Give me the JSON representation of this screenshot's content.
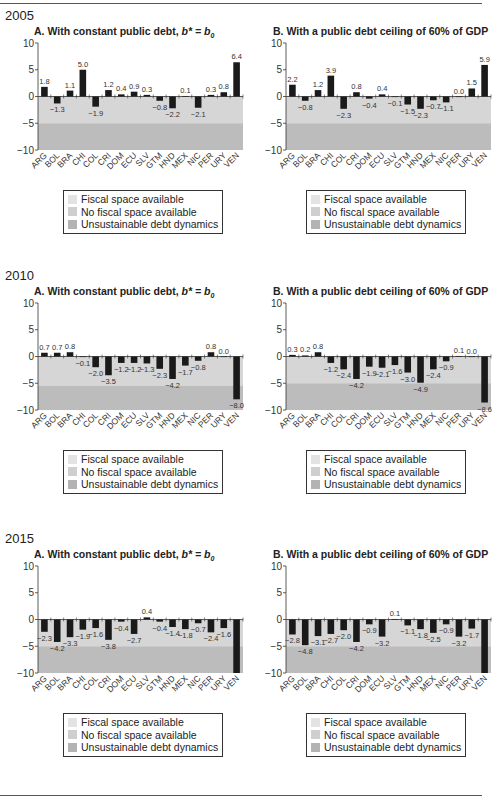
{
  "countries": [
    "ARG",
    "BOL",
    "BRA",
    "CHI",
    "COL",
    "CRI",
    "DOM",
    "ECU",
    "SLV",
    "GTM",
    "HND",
    "MEX",
    "NIC",
    "PER",
    "URY",
    "VEN"
  ],
  "legend": [
    {
      "label": "Fiscal space available",
      "color": "#e3e3e3"
    },
    {
      "label": "No fiscal space available",
      "color": "#cfcfcf"
    },
    {
      "label": "Unsustainable debt dynamics",
      "color": "#b3b3b3"
    }
  ],
  "colors": {
    "zone_no_space": "#d6d6d6",
    "zone_unsustainable": "#bcbcbc",
    "bar": "#1a1a1a",
    "axis": "#333333"
  },
  "years": [
    {
      "year": "2005",
      "panels": [
        {
          "title_prefix": "A. With constant public debt, ",
          "title_math": "b* = b",
          "title_sub": "0",
          "threshold": -5.0,
          "values": [
            1.8,
            -1.3,
            1.1,
            5.0,
            -1.9,
            1.2,
            0.4,
            0.9,
            0.3,
            -0.8,
            -2.2,
            0.1,
            -2.1,
            0.3,
            0.8,
            6.4
          ],
          "labels": [
            "1.8",
            "−1.3",
            "1.1",
            "5.0",
            "−1.9",
            "1.2",
            "0.4",
            "0.9",
            "0.3",
            "−0.8",
            "−2.2",
            "0.1",
            "−2.1",
            "0.3",
            "0.8",
            "6.4"
          ]
        },
        {
          "title_prefix": "B. With a public debt ceiling of 60% of GDP",
          "title_math": "",
          "title_sub": "",
          "threshold": -5.0,
          "values": [
            2.2,
            -0.8,
            1.2,
            3.9,
            -2.3,
            0.8,
            -0.4,
            0.4,
            -0.1,
            -1.5,
            -2.3,
            -0.7,
            -1.1,
            0.0,
            1.5,
            5.9
          ],
          "labels": [
            "2.2",
            "−0.8",
            "1.2",
            "3.9",
            "−2.3",
            "0.8",
            "−0.4",
            "0.4",
            "−0.1",
            "−1.5",
            "−2.3",
            "−0.7",
            "−1.1",
            "0.0",
            "1.5",
            "5.9"
          ]
        }
      ]
    },
    {
      "year": "2010",
      "panels": [
        {
          "title_prefix": "A. With constant public debt, ",
          "title_math": "b* = b",
          "title_sub": "0",
          "threshold": -5.5,
          "values": [
            0.7,
            0.7,
            0.8,
            -0.1,
            -2.0,
            -3.5,
            -1.2,
            -1.2,
            -1.3,
            -2.3,
            -4.2,
            -1.7,
            -0.8,
            0.8,
            0.0,
            -8.0
          ],
          "labels": [
            "0.7",
            "0.7",
            "0.8",
            "−0.1",
            "−2.0",
            "−3.5",
            "−1.2",
            "−1.2",
            "−1.3",
            "−2.3",
            "−4.2",
            "−1.7",
            "−0.8",
            "0.8",
            "0.0",
            "−8.0"
          ]
        },
        {
          "title_prefix": "B. With a public debt ceiling of 60% of GDP",
          "title_math": "",
          "title_sub": "",
          "threshold": -5.0,
          "values": [
            0.3,
            0.2,
            0.8,
            -1.2,
            -2.4,
            -4.2,
            -1.9,
            -2.1,
            -1.6,
            -3.0,
            -4.9,
            -2.4,
            -0.9,
            0.1,
            0.0,
            -8.6
          ],
          "labels": [
            "0.3",
            "0.2",
            "0.8",
            "−1.2",
            "−2.4",
            "−4.2",
            "−1.9",
            "−2.1",
            "−1.6",
            "−3.0",
            "−4.9",
            "−2.4",
            "−0.9",
            "0.1",
            "0.0",
            "−8.6"
          ]
        }
      ]
    },
    {
      "year": "2015",
      "panels": [
        {
          "title_prefix": "A. With constant public debt, ",
          "title_math": "b* = b",
          "title_sub": "0",
          "threshold": -5.0,
          "values": [
            -2.3,
            -4.2,
            -3.3,
            -1.9,
            -1.6,
            -3.8,
            -0.4,
            -2.7,
            0.4,
            -0.4,
            -1.4,
            -1.8,
            -0.7,
            -2.4,
            -1.6,
            -10.0
          ],
          "labels": [
            "−2.3",
            "−4.2",
            "−3.3",
            "−1.9",
            "−1.6",
            "−3.8",
            "−0.4",
            "−2.7",
            "0.4",
            "−0.4",
            "−1.4",
            "−1.8",
            "−0.7",
            "−2.4",
            "−1.6",
            ""
          ]
        },
        {
          "title_prefix": "B. With a public debt ceiling of 60% of GDP",
          "title_math": "",
          "title_sub": "",
          "threshold": -5.0,
          "values": [
            -2.8,
            -4.8,
            -3.1,
            -2.7,
            -2.0,
            -4.2,
            -0.9,
            -3.2,
            0.1,
            -1.1,
            -1.8,
            -2.5,
            -0.9,
            -3.2,
            -1.7,
            -10.0
          ],
          "labels": [
            "−2.8",
            "−4.8",
            "−3.1",
            "−2.7",
            "−2.0",
            "−4.2",
            "−0.9",
            "−3.2",
            "0.1",
            "−1.1",
            "−1.8",
            "−2.5",
            "−0.9",
            "−3.2",
            "−1.7",
            ""
          ]
        }
      ]
    }
  ],
  "axis": {
    "ymin": -10,
    "ymax": 10,
    "ticks": [
      "10",
      "5",
      "0",
      "−5",
      "−10"
    ]
  },
  "chart_data": [
    {
      "type": "bar",
      "title": "2005 A. With constant public debt, b* = b0",
      "categories": [
        "ARG",
        "BOL",
        "BRA",
        "CHI",
        "COL",
        "CRI",
        "DOM",
        "ECU",
        "SLV",
        "GTM",
        "HND",
        "MEX",
        "NIC",
        "PER",
        "URY",
        "VEN"
      ],
      "values": [
        1.8,
        -1.3,
        1.1,
        5.0,
        -1.9,
        1.2,
        0.4,
        0.9,
        0.3,
        -0.8,
        -2.2,
        0.1,
        -2.1,
        0.3,
        0.8,
        6.4
      ],
      "ylim": [
        -10,
        10
      ],
      "zones": {
        "no_fiscal_space": [
          -5,
          0
        ],
        "unsustainable": [
          -10,
          -5
        ]
      }
    },
    {
      "type": "bar",
      "title": "2005 B. With a public debt ceiling of 60% of GDP",
      "categories": [
        "ARG",
        "BOL",
        "BRA",
        "CHI",
        "COL",
        "CRI",
        "DOM",
        "ECU",
        "SLV",
        "GTM",
        "HND",
        "MEX",
        "NIC",
        "PER",
        "URY",
        "VEN"
      ],
      "values": [
        2.2,
        -0.8,
        1.2,
        3.9,
        -2.3,
        0.8,
        -0.4,
        0.4,
        -0.1,
        -1.5,
        -2.3,
        -0.7,
        -1.1,
        0.0,
        1.5,
        5.9
      ],
      "ylim": [
        -10,
        10
      ],
      "zones": {
        "no_fiscal_space": [
          -5,
          0
        ],
        "unsustainable": [
          -10,
          -5
        ]
      }
    },
    {
      "type": "bar",
      "title": "2010 A. With constant public debt, b* = b0",
      "categories": [
        "ARG",
        "BOL",
        "BRA",
        "CHI",
        "COL",
        "CRI",
        "DOM",
        "ECU",
        "SLV",
        "GTM",
        "HND",
        "MEX",
        "NIC",
        "PER",
        "URY",
        "VEN"
      ],
      "values": [
        0.7,
        0.7,
        0.8,
        -0.1,
        -2.0,
        -3.5,
        -1.2,
        -1.2,
        -1.3,
        -2.3,
        -4.2,
        -1.7,
        -0.8,
        0.8,
        0.0,
        -8.0
      ],
      "ylim": [
        -10,
        10
      ],
      "zones": {
        "no_fiscal_space": [
          -5.5,
          0
        ],
        "unsustainable": [
          -10,
          -5.5
        ]
      }
    },
    {
      "type": "bar",
      "title": "2010 B. With a public debt ceiling of 60% of GDP",
      "categories": [
        "ARG",
        "BOL",
        "BRA",
        "CHI",
        "COL",
        "CRI",
        "DOM",
        "ECU",
        "SLV",
        "GTM",
        "HND",
        "MEX",
        "NIC",
        "PER",
        "URY",
        "VEN"
      ],
      "values": [
        0.3,
        0.2,
        0.8,
        -1.2,
        -2.4,
        -4.2,
        -1.9,
        -2.1,
        -1.6,
        -3.0,
        -4.9,
        -2.4,
        -0.9,
        0.1,
        0.0,
        -8.6
      ],
      "ylim": [
        -10,
        10
      ],
      "zones": {
        "no_fiscal_space": [
          -5,
          0
        ],
        "unsustainable": [
          -10,
          -5
        ]
      }
    },
    {
      "type": "bar",
      "title": "2015 A. With constant public debt, b* = b0",
      "categories": [
        "ARG",
        "BOL",
        "BRA",
        "CHI",
        "COL",
        "CRI",
        "DOM",
        "ECU",
        "SLV",
        "GTM",
        "HND",
        "MEX",
        "NIC",
        "PER",
        "URY",
        "VEN"
      ],
      "values": [
        -2.3,
        -4.2,
        -3.3,
        -1.9,
        -1.6,
        -3.8,
        -0.4,
        -2.7,
        0.4,
        -0.4,
        -1.4,
        -1.8,
        -0.7,
        -2.4,
        -1.6,
        -10.0
      ],
      "ylim": [
        -10,
        10
      ],
      "note": "VEN bar extends beyond axis, unlabeled"
    },
    {
      "type": "bar",
      "title": "2015 B. With a public debt ceiling of 60% of GDP",
      "categories": [
        "ARG",
        "BOL",
        "BRA",
        "CHI",
        "COL",
        "CRI",
        "DOM",
        "ECU",
        "SLV",
        "GTM",
        "HND",
        "MEX",
        "NIC",
        "PER",
        "URY",
        "VEN"
      ],
      "values": [
        -2.8,
        -4.8,
        -3.1,
        -2.7,
        -2.0,
        -4.2,
        -0.9,
        -3.2,
        0.1,
        -1.1,
        -1.8,
        -2.5,
        -0.9,
        -3.2,
        -1.7,
        -10.0
      ],
      "ylim": [
        -10,
        10
      ],
      "note": "VEN bar extends beyond axis, unlabeled"
    }
  ]
}
